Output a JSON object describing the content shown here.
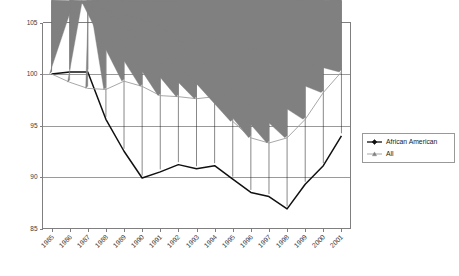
{
  "chart_data": {
    "type": "line",
    "title": "",
    "subtitle": "",
    "xlabel": "",
    "ylabel": "",
    "grid": true,
    "legend_position": "right",
    "xlim": [
      1985,
      2001
    ],
    "ylim": [
      85,
      105
    ],
    "ytick_labels": [
      "105",
      "100",
      "95",
      "90",
      "85"
    ],
    "ytick_values": [
      105,
      100,
      95,
      90,
      85
    ],
    "categories": [
      "1985",
      "1986",
      "1987",
      "1988",
      "1989",
      "1990",
      "1991",
      "1992",
      "1993",
      "1994",
      "1995",
      "1996",
      "1997",
      "1998",
      "1999",
      "2000",
      "2001"
    ],
    "x": [
      1985,
      1986,
      1987,
      1988,
      1989,
      1990,
      1991,
      1992,
      1993,
      1994,
      1995,
      1996,
      1997,
      1998,
      1999,
      2000,
      2001
    ],
    "series": [
      {
        "name": "African American",
        "color": "#101010",
        "marker": "diamond",
        "values": [
          100.0,
          100.2,
          100.2,
          95.6,
          92.5,
          89.9,
          90.5,
          91.2,
          90.8,
          91.1,
          89.8,
          88.5,
          88.1,
          86.9,
          89.3,
          91.1,
          94.0
        ]
      },
      {
        "name": "All",
        "color": "#808080",
        "marker": "triangle",
        "values": [
          100.0,
          99.2,
          98.6,
          98.5,
          99.3,
          98.8,
          97.9,
          97.8,
          97.6,
          97.8,
          95.4,
          93.8,
          93.3,
          93.8,
          95.6,
          98.2,
          100.2
        ]
      }
    ],
    "legend": [
      {
        "label": "African American",
        "color": "#101010",
        "marker": "diamond"
      },
      {
        "label": "All",
        "color": "#808080",
        "marker": "triangle"
      }
    ]
  }
}
